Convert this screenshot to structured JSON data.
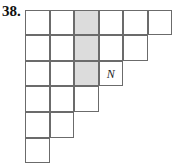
{
  "problem": {
    "number": "38."
  },
  "grid": {
    "row_lengths": [
      6,
      5,
      4,
      3,
      2,
      1
    ],
    "shaded": [
      [
        0,
        2
      ],
      [
        1,
        2
      ],
      [
        2,
        2
      ]
    ],
    "labels": [
      {
        "row": 2,
        "col": 3,
        "text": "N"
      }
    ],
    "colors": {
      "shaded": "#dcdcdc",
      "border": "#6b6b6b"
    }
  }
}
